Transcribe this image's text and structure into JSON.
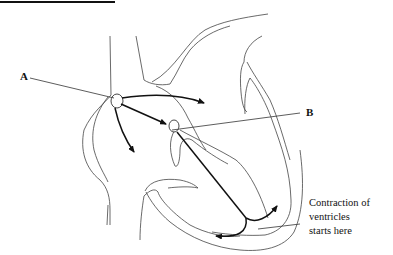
{
  "diagram": {
    "labels": {
      "a": "A",
      "b": "B"
    },
    "caption": {
      "line1": "Contraction of",
      "line2": "ventricles",
      "line3": "starts here"
    },
    "colors": {
      "line": "#333333",
      "arrow": "#111111",
      "background": "#ffffff"
    }
  }
}
